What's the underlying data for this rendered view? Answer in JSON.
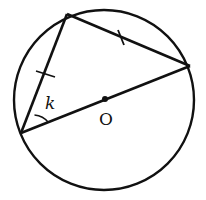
{
  "diagram": {
    "stroke_color": "#111111",
    "background": "#ffffff",
    "circle": {
      "cx": 104,
      "cy": 100,
      "r": 90
    },
    "center": {
      "x": 105,
      "y": 99,
      "label": "O"
    },
    "vertices": {
      "top": {
        "x": 67,
        "y": 14
      },
      "right": {
        "x": 190,
        "y": 66
      },
      "left": {
        "x": 21,
        "y": 133
      }
    },
    "angle_label": {
      "text": "k",
      "x": 45,
      "y": 109
    },
    "tick_marks": [
      {
        "segment": "left-top",
        "x1": 36,
        "y1": 71,
        "x2": 55,
        "y2": 77
      },
      {
        "segment": "top-right",
        "x1": 118,
        "y1": 30,
        "x2": 124,
        "y2": 44
      }
    ]
  }
}
